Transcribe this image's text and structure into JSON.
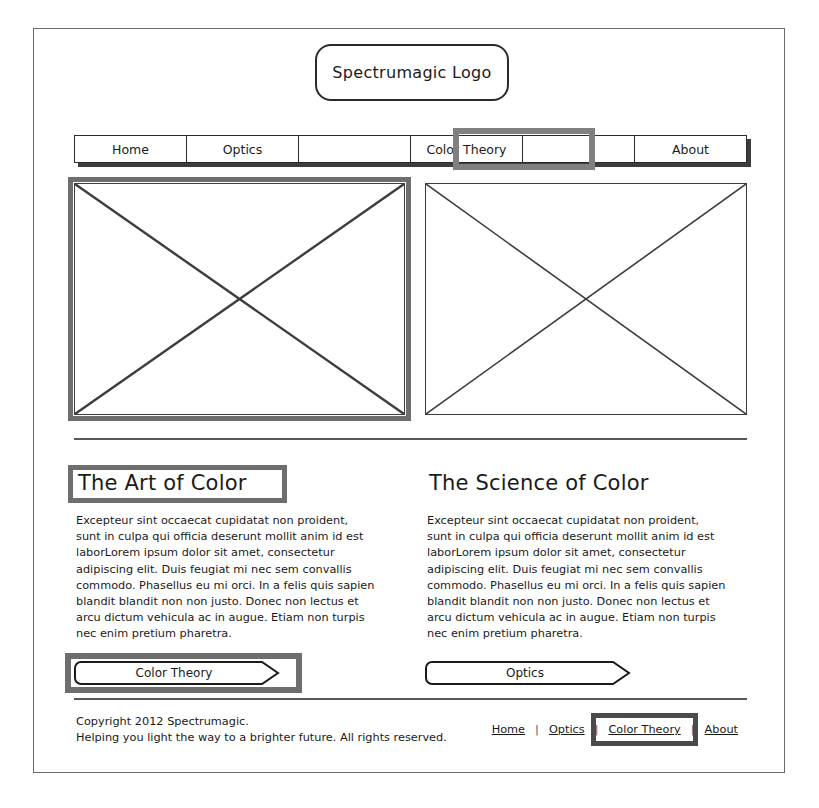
{
  "logo": {
    "text": "Spectrumagic Logo"
  },
  "nav": {
    "items": [
      {
        "label": "Home",
        "selected": false
      },
      {
        "label": "Optics",
        "selected": false
      },
      {
        "label": "",
        "selected": false
      },
      {
        "label": "Color Theory",
        "selected": true
      },
      {
        "label": "",
        "selected": false
      },
      {
        "label": "About",
        "selected": false
      }
    ]
  },
  "media": {
    "left": {
      "name": "image-placeholder",
      "selected": true
    },
    "right": {
      "name": "image-placeholder",
      "selected": false
    }
  },
  "columns": {
    "left": {
      "heading": "The Art of Color",
      "heading_selected": true,
      "body": "Excepteur sint occaecat cupidatat non proident, sunt in culpa qui officia deserunt mollit anim id est laborLorem ipsum dolor sit amet, consectetur adipiscing elit. Duis feugiat mi nec sem convallis commodo. Phasellus eu mi orci. In a felis quis sapien blandit blandit non non justo. Donec non lectus et arcu dictum vehicula ac in augue. Etiam non turpis nec enim pretium pharetra.",
      "button": {
        "label": "Color Theory",
        "selected": true
      }
    },
    "right": {
      "heading": "The Science of Color",
      "heading_selected": false,
      "body": "Excepteur sint occaecat cupidatat non proident, sunt in culpa qui officia deserunt mollit anim id est laborLorem ipsum dolor sit amet, consectetur adipiscing elit. Duis feugiat mi nec sem convallis commodo. Phasellus eu mi orci. In a felis quis sapien blandit blandit non non justo. Donec non lectus et arcu dictum vehicula ac in augue. Etiam non turpis nec enim pretium pharetra.",
      "button": {
        "label": "Optics",
        "selected": false
      }
    }
  },
  "footer": {
    "copyright_line1": "Copyright 2012 Spectrumagic.",
    "copyright_line2": "Helping you light the way to a brighter future. All rights reserved.",
    "separator": "|",
    "links": [
      {
        "label": "Home",
        "selected": false
      },
      {
        "label": "Optics",
        "selected": false
      },
      {
        "label": "Color Theory",
        "selected": true
      },
      {
        "label": "About",
        "selected": false
      }
    ]
  },
  "colors": {
    "ink": "#1a1a1a",
    "selection": "#6e6e6e",
    "selection_nav": "#808080",
    "frame": "#6b6b6b"
  }
}
